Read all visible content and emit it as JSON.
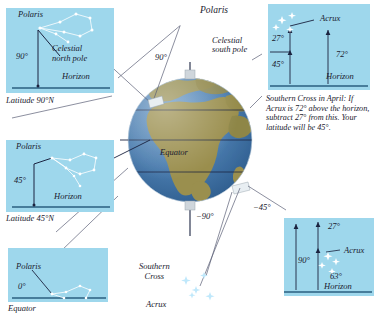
{
  "figure": {
    "type": "astronomy-diagram"
  },
  "globe": {
    "equator_label": "Equator",
    "ocean_color": "#4a7cae",
    "land_color": "#9a8f4e",
    "polaris_label": "Polaris",
    "celestial_south_pole_label": "Celestial\nsouth pole",
    "southern_cross_label": "Southern\nCross",
    "acrux_label": "Acrux",
    "angle_north_pole": "90°",
    "angle_mid_north": "45°",
    "angle_south_pole": "−90°",
    "angle_mid_south": "−45°"
  },
  "panels": {
    "top_left": {
      "name": "Latitude 90°N view",
      "star_label": "Polaris",
      "pole_label": "Celestial\nnorth pole",
      "angle": "90°",
      "horizon": "Horizon",
      "caption": "Latitude 90°N"
    },
    "mid_left": {
      "name": "Latitude 45°N view",
      "star_label": "Polaris",
      "angle": "45°",
      "horizon": "Horizon",
      "caption": "Latitude 45°N"
    },
    "bottom_left": {
      "name": "Equator view",
      "star_label": "Polaris",
      "angle": "0°",
      "caption": "Equator"
    },
    "top_right": {
      "name": "Southern Cross 45°S view",
      "star_label": "Acrux",
      "angle_small": "27°",
      "angle_lat": "45°",
      "angle_alt": "72°",
      "horizon": "Horizon"
    },
    "bottom_right": {
      "name": "Southern Cross 90°S view",
      "star_label": "Acrux",
      "angle_small": "27°",
      "angle_lat": "90°",
      "angle_alt": "63°",
      "horizon": "Horizon"
    }
  },
  "caption": {
    "text": "Southern Cross in April: If Acrux is 72° above the horizon, subtract 27° from this. Your latitude will be 45°."
  },
  "colors": {
    "panel_bg": "#9ed7ec",
    "ink": "#1b2340",
    "horizon_line": "#2a5f80",
    "star": "#bfe8fb"
  }
}
